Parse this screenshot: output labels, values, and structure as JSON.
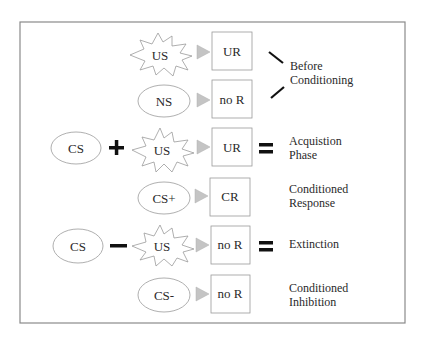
{
  "colors": {
    "frame": "#8a8a8a",
    "shape_stroke": "#9a9a9a",
    "arrow_fill": "#c4c4c4",
    "operator": "#111111",
    "text": "#2a2a2a"
  },
  "rows": [
    {
      "stimulus": "US",
      "stimulus_shape": "starburst",
      "response": "UR"
    },
    {
      "stimulus": "NS",
      "stimulus_shape": "ellipse",
      "response": "no R"
    },
    {
      "prefix": "CS",
      "operator": "+",
      "stimulus": "US",
      "stimulus_shape": "starburst",
      "response": "UR",
      "result_op": "=",
      "label": [
        "Acquistion",
        "Phase"
      ]
    },
    {
      "stimulus": "CS+",
      "stimulus_shape": "ellipse",
      "response": "CR",
      "label": [
        "Conditioned",
        "Response"
      ]
    },
    {
      "prefix": "CS",
      "operator": "−",
      "stimulus": "US",
      "stimulus_shape": "starburst",
      "response": "no R",
      "result_op": "=",
      "label": [
        "Extinction"
      ]
    },
    {
      "stimulus": "CS-",
      "stimulus_shape": "ellipse",
      "response": "no R",
      "label": [
        "Conditioned",
        "Inhibition"
      ]
    }
  ],
  "group_label": [
    "Before",
    "Conditioning"
  ]
}
